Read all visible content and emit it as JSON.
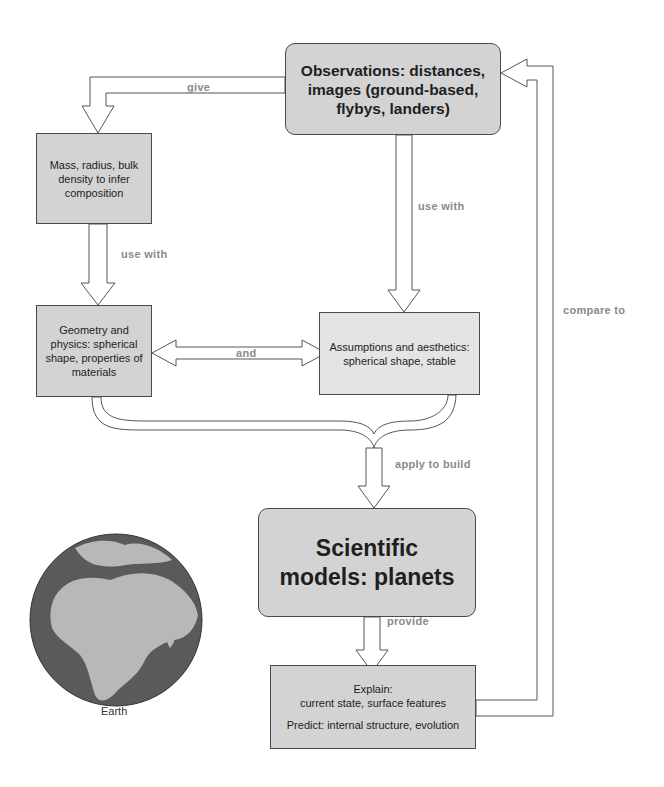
{
  "boxes": {
    "observations": {
      "text": "Observations: distances, images (ground-based, flybys, landers)"
    },
    "mass": {
      "text": "Mass, radius, bulk density to infer composition"
    },
    "geometry": {
      "text": "Geometry and physics: spherical shape, properties of materials"
    },
    "assumptions": {
      "text": "Assumptions and aesthetics: spherical shape, stable"
    },
    "scientific_models": {
      "text": "Scientific models: planets"
    },
    "explain_predict": {
      "explain_title": "Explain:",
      "explain_text": "current state, surface features",
      "predict_text": "Predict: internal structure, evolution"
    }
  },
  "arrow_labels": {
    "give": "give",
    "use_with_left": "use with",
    "use_with_right": "use with",
    "and": "and",
    "apply_to_build": "apply to build",
    "provide": "provide",
    "compare_to": "compare to"
  },
  "image": {
    "caption": "Earth",
    "icon": "earth-globe-icon"
  },
  "colors": {
    "box_dark": "#d3d3d3",
    "box_light": "#e4e4e4",
    "border": "#4a4a4a",
    "label": "#8a8a8a",
    "ocean": "#5a5a5a",
    "land": "#b8b8b8"
  }
}
